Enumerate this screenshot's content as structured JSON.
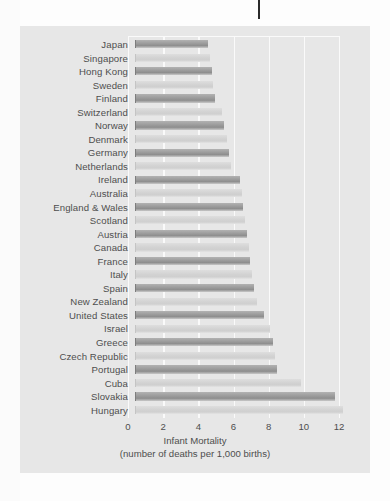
{
  "chart_data": {
    "type": "bar",
    "orientation": "horizontal",
    "title": "",
    "xlabel": "Infant Mortality",
    "xlabel_sub": "(number of deaths per 1,000 births)",
    "ylabel": "",
    "xlim": [
      0,
      12
    ],
    "xticks": [
      0,
      2,
      4,
      6,
      8,
      10,
      12
    ],
    "xtick_labels": [
      "0",
      "2",
      "4",
      "6",
      "8",
      "10",
      "12"
    ],
    "grid": "vertical",
    "legend": "none",
    "categories": [
      "Japan",
      "Singapore",
      "Hong Kong",
      "Sweden",
      "Finland",
      "Switzerland",
      "Norway",
      "Denmark",
      "Germany",
      "Netherlands",
      "Ireland",
      "Australia",
      "England & Wales",
      "Scotland",
      "Austria",
      "Canada",
      "France",
      "Italy",
      "Spain",
      "New Zealand",
      "United States",
      "Israel",
      "Greece",
      "Czech Republic",
      "Portugal",
      "Cuba",
      "Slovakia",
      "Hungary"
    ],
    "values": [
      4.1,
      4.2,
      4.3,
      4.4,
      4.5,
      4.9,
      5.0,
      5.2,
      5.3,
      5.4,
      5.9,
      6.0,
      6.1,
      6.2,
      6.3,
      6.4,
      6.5,
      6.6,
      6.7,
      6.9,
      7.3,
      7.6,
      7.8,
      7.9,
      8.0,
      9.4,
      11.3,
      11.8
    ],
    "colors": {
      "bar_dark": "#9b9b9b",
      "bar_light": "#d4d4d4",
      "panel_background": "#e7e7e7",
      "gridline": "#fafafa",
      "text": "#4e4e4e"
    }
  },
  "artifacts": {
    "scan_mark_name": "scan-artifact-line"
  }
}
